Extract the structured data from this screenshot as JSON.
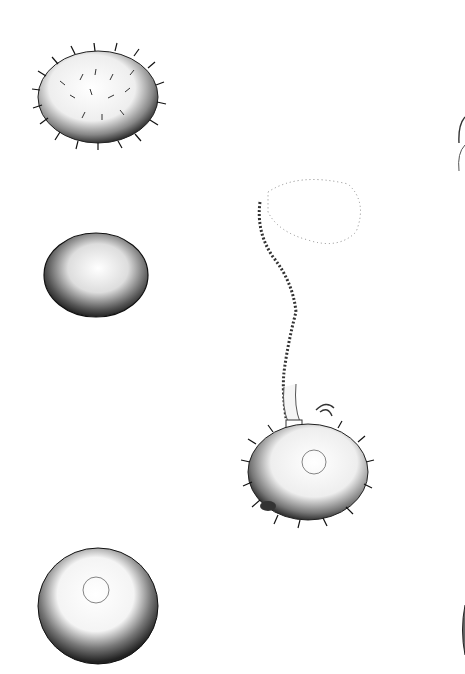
{
  "plate": {
    "description": "Engraved plate of pollen grains",
    "figures": [
      {
        "id": "spiny-grain-top-left",
        "label": "Spiny pollen grain"
      },
      {
        "id": "granular-grain-mid-left",
        "label": "Granular smooth pollen grain"
      },
      {
        "id": "smooth-grain-bottom-left",
        "label": "Smooth pollen grain with pore"
      },
      {
        "id": "germinating-grain-center",
        "label": "Spiny pollen grain emitting pollen tube"
      },
      {
        "id": "partial-grain-right-top",
        "label": "Partially visible grain at right edge"
      },
      {
        "id": "partial-grain-right-bottom",
        "label": "Partially visible grain at right edge"
      }
    ]
  }
}
